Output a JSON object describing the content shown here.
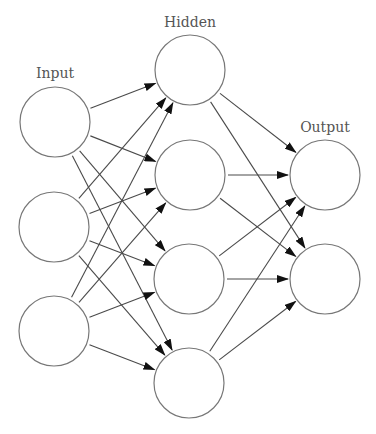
{
  "diagram": {
    "colors": {
      "node_stroke": "#777777",
      "edge": "#4a4a4a",
      "arrowhead": "#111111",
      "label": "#555555",
      "background": "#ffffff"
    },
    "layers": [
      {
        "name": "input",
        "label": "Input",
        "label_pos": [
          55,
          78
        ],
        "nodes": [
          [
            55,
            122
          ],
          [
            54,
            227
          ],
          [
            54,
            331
          ]
        ]
      },
      {
        "name": "hidden",
        "label": "Hidden",
        "label_pos": [
          190,
          27
        ],
        "nodes": [
          [
            190,
            70
          ],
          [
            190,
            175
          ],
          [
            189,
            279
          ],
          [
            189,
            383
          ]
        ]
      },
      {
        "name": "output",
        "label": "Output",
        "label_pos": [
          325,
          132
        ],
        "nodes": [
          [
            325,
            175
          ],
          [
            325,
            279
          ]
        ]
      }
    ],
    "node_radius": 35,
    "connections": "fully-connected between adjacent layers, directed left to right"
  }
}
